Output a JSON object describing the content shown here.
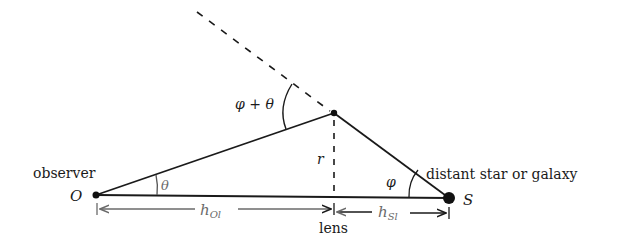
{
  "diagram": {
    "labels": {
      "observer": "observer",
      "observer_point": "O",
      "source_label": "distant star or galaxy",
      "source_point": "S",
      "lens": "lens",
      "radius": "r",
      "angle_theta": "θ",
      "angle_phi": "φ",
      "angle_sum": "φ + θ",
      "dist_observer_lens": "h",
      "dist_observer_lens_sub": "Ol",
      "dist_source_lens": "h",
      "dist_source_lens_sub": "Sl"
    },
    "points": {
      "O": [
        96,
        195
      ],
      "S": [
        449,
        198
      ],
      "deflection": [
        334,
        113
      ],
      "lens_foot": [
        334,
        196
      ],
      "dashed_start": [
        197,
        12
      ]
    },
    "colors": {
      "line": "#1a1a1a",
      "dimension": "#6a6a6a",
      "background": "#ffffff"
    }
  }
}
